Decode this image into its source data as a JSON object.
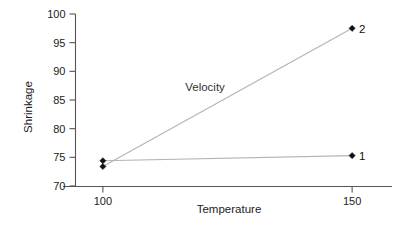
{
  "chart_data": {
    "type": "line",
    "title": "",
    "subtitle": "",
    "xlabel": "Temperature",
    "ylabel": "Shrinkage",
    "x": [
      100,
      150
    ],
    "xlim": [
      92,
      158
    ],
    "ylim": [
      70,
      100
    ],
    "xticks": [
      100,
      150
    ],
    "xtick_labels": [
      "100",
      "150"
    ],
    "yticks": [
      70,
      75,
      80,
      85,
      90,
      95,
      100
    ],
    "ytick_labels": [
      "70",
      "75",
      "80",
      "85",
      "90",
      "95",
      "100"
    ],
    "grid": false,
    "legend_position": "inline-point-labels",
    "annotations": [
      {
        "text": "Velocity",
        "x": 120.5,
        "y": 86.5,
        "name": "velocity-factor-annotation"
      }
    ],
    "series": [
      {
        "name": "1",
        "label": "1",
        "values": [
          74.4,
          75.3
        ],
        "marker": "diamond",
        "color": "#111111",
        "line_color": "#b4b4b4",
        "end_label": "1"
      },
      {
        "name": "2",
        "label": "2",
        "values": [
          73.4,
          97.5
        ],
        "marker": "diamond",
        "color": "#111111",
        "line_color": "#b4b4b4",
        "end_label": "2"
      }
    ]
  },
  "figure": {
    "axis_color": "#555555",
    "line_color": "#b4b4b4",
    "marker_color": "#111111",
    "text_color": "#222222",
    "background": "#ffffff"
  }
}
